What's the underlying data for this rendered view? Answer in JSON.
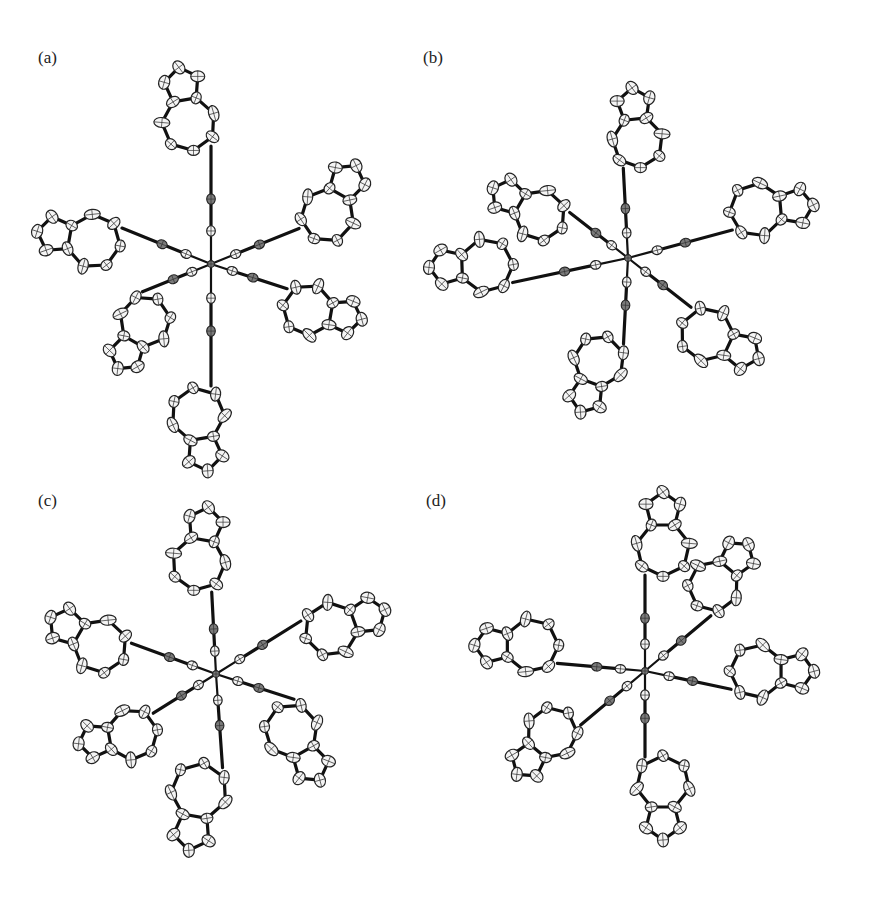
{
  "figure": {
    "panels": [
      {
        "id": "a",
        "label": "(a)",
        "label_pos": [
          38,
          62
        ],
        "center": [
          211,
          264
        ],
        "arms": [
          {
            "angle": -90,
            "len": 118,
            "dark": 1,
            "ring": {
              "side": -1,
              "rot": -100,
              "scale": 1.0
            }
          },
          {
            "angle": -22,
            "len": 95,
            "dark": 1,
            "ring": {
              "side": 1,
              "rot": -60,
              "scale": 1.0
            }
          },
          {
            "angle": 18,
            "len": 80,
            "dark": 1,
            "ring": {
              "side": 1,
              "rot": 10,
              "scale": 0.95
            }
          },
          {
            "angle": 90,
            "len": 122,
            "dark": 1,
            "ring": {
              "side": 1,
              "rot": 80,
              "scale": 1.0
            }
          },
          {
            "angle": 158,
            "len": 74,
            "dark": 1,
            "ring": {
              "side": -1,
              "rot": 120,
              "scale": 0.95
            }
          },
          {
            "angle": -158,
            "len": 96,
            "dark": 1,
            "ring": {
              "side": -1,
              "rot": -170,
              "scale": 1.0
            }
          }
        ]
      },
      {
        "id": "b",
        "label": "(b)",
        "label_pos": [
          423,
          62
        ],
        "center": [
          628,
          258
        ],
        "arms": [
          {
            "angle": -93,
            "len": 90,
            "dark": 1,
            "ring": {
              "side": 1,
              "rot": -96,
              "scale": 0.95
            }
          },
          {
            "angle": -15,
            "len": 108,
            "dark": 1,
            "ring": {
              "side": -1,
              "rot": -5,
              "scale": 1.0
            }
          },
          {
            "angle": 38,
            "len": 80,
            "dark": 1,
            "ring": {
              "side": 1,
              "rot": 25,
              "scale": 1.0
            }
          },
          {
            "angle": 93,
            "len": 86,
            "dark": 1,
            "ring": {
              "side": 1,
              "rot": 110,
              "scale": 0.95
            }
          },
          {
            "angle": 168,
            "len": 118,
            "dark": 1,
            "ring": {
              "side": 1,
              "rot": 178,
              "scale": 1.0
            }
          },
          {
            "angle": -142,
            "len": 74,
            "dark": 1,
            "ring": {
              "side": -1,
              "rot": -150,
              "scale": 0.95
            }
          }
        ]
      },
      {
        "id": "c",
        "label": "(c)",
        "label_pos": [
          38,
          505
        ],
        "center": [
          216,
          674
        ],
        "arms": [
          {
            "angle": -93,
            "len": 82,
            "dark": 1,
            "ring": {
              "side": -1,
              "rot": -80,
              "scale": 1.0
            }
          },
          {
            "angle": -32,
            "len": 100,
            "dark": 1,
            "ring": {
              "side": 1,
              "rot": -20,
              "scale": 1.0
            }
          },
          {
            "angle": 18,
            "len": 82,
            "dark": 1,
            "ring": {
              "side": 1,
              "rot": 60,
              "scale": 1.0
            }
          },
          {
            "angle": 86,
            "len": 94,
            "dark": 1,
            "ring": {
              "side": 1,
              "rot": 100,
              "scale": 1.05
            }
          },
          {
            "angle": 148,
            "len": 74,
            "dark": 1,
            "ring": {
              "side": -1,
              "rot": 170,
              "scale": 0.95
            }
          },
          {
            "angle": -160,
            "len": 90,
            "dark": 1,
            "ring": {
              "side": -1,
              "rot": -150,
              "scale": 1.0
            }
          }
        ]
      },
      {
        "id": "d",
        "label": "(d)",
        "label_pos": [
          426,
          505
        ],
        "center": [
          645,
          671
        ],
        "arms": [
          {
            "angle": -90,
            "len": 96,
            "dark": 1,
            "ring": {
              "side": 1,
              "rot": -90,
              "scale": 1.0
            }
          },
          {
            "angle": -40,
            "len": 86,
            "dark": 1,
            "ring": {
              "side": -1,
              "rot": -50,
              "scale": 0.95
            }
          },
          {
            "angle": 12,
            "len": 88,
            "dark": 1,
            "ring": {
              "side": -1,
              "rot": 0,
              "scale": 1.0
            }
          },
          {
            "angle": 90,
            "len": 86,
            "dark": 1,
            "ring": {
              "side": -1,
              "rot": 90,
              "scale": 1.0
            }
          },
          {
            "angle": 140,
            "len": 84,
            "dark": 1,
            "ring": {
              "side": 1,
              "rot": 130,
              "scale": 0.95
            }
          },
          {
            "angle": -175,
            "len": 88,
            "dark": 1,
            "ring": {
              "side": 1,
              "rot": 180,
              "scale": 1.0
            }
          }
        ]
      }
    ]
  }
}
